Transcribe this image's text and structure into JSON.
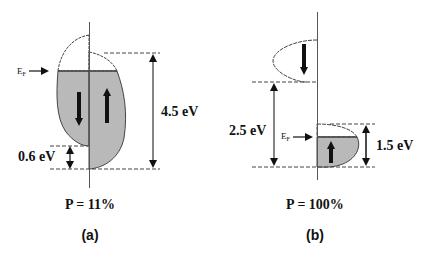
{
  "colors": {
    "fill": "#b9b9b9",
    "line": "#333333",
    "arrow": "#111111",
    "background": "#ffffff"
  },
  "panel_a": {
    "fermi_label": "E",
    "fermi_sub": "F",
    "gap_large_label": "4.5 eV",
    "gap_small_label": "0.6 eV",
    "polarization_label": "P = 11%",
    "caption": "(a)",
    "spin_down_icon": "arrow-down",
    "spin_up_icon": "arrow-up"
  },
  "panel_b": {
    "fermi_label": "E",
    "fermi_sub": "F",
    "gap_label": "2.5 eV",
    "band_width_label": "1.5 eV",
    "polarization_label": "P = 100%",
    "caption": "(b)",
    "spin_down_icon": "arrow-down",
    "spin_up_icon": "arrow-up"
  }
}
